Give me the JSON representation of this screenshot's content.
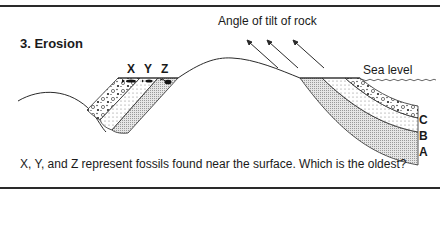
{
  "figure": {
    "title": "3. Erosion",
    "tilt_label": "Angle of tilt of rock",
    "sea_level_label": "Sea level",
    "fossils": [
      {
        "label": "X",
        "x": 131
      },
      {
        "label": "Y",
        "x": 148
      },
      {
        "label": "Z",
        "x": 165
      }
    ],
    "layers": [
      {
        "label": "C",
        "y": 115
      },
      {
        "label": "B",
        "y": 131
      },
      {
        "label": "A",
        "y": 147
      }
    ],
    "question": "X, Y, and Z represent fossils found near the surface. Which is the oldest?"
  },
  "colors": {
    "line": "#2a2a2a",
    "layer_a": "#d9d9d9",
    "layer_b": "#f4f4f4",
    "layer_c": "#ffffff"
  }
}
